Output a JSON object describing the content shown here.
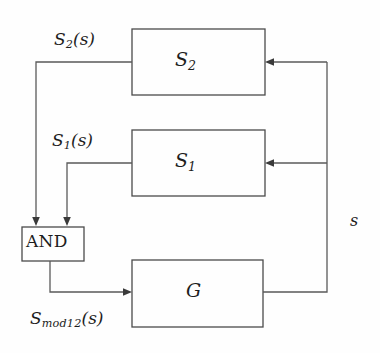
{
  "diagram": {
    "background_color": "#fefefe",
    "line_color": "#5a5a5a",
    "text_color": "#1d1d1d",
    "blocks": [
      {
        "id": "s2",
        "label": "S",
        "subscript": "2",
        "name": "block-s2",
        "x": 132,
        "y": 29,
        "w": 133,
        "h": 66
      },
      {
        "id": "s1",
        "label": "S",
        "subscript": "1",
        "name": "block-s1",
        "x": 132,
        "y": 130,
        "w": 133,
        "h": 66
      },
      {
        "id": "g",
        "label": "G",
        "subscript": "",
        "name": "block-g",
        "x": 132,
        "y": 260,
        "w": 131,
        "h": 67
      },
      {
        "id": "and",
        "label": "AND",
        "subscript": "",
        "name": "block-and",
        "x": 22,
        "y": 227,
        "w": 62,
        "h": 34
      }
    ],
    "signals": [
      {
        "id": "s2s",
        "label": "S",
        "subscript": "2",
        "arg": "(s)",
        "name": "signal-label-s2"
      },
      {
        "id": "s1s",
        "label": "S",
        "subscript": "1",
        "arg": "(s)",
        "name": "signal-label-s1"
      },
      {
        "id": "mod",
        "label": "S",
        "subscript": "mod12",
        "arg": "(s)",
        "name": "signal-label-smod12"
      },
      {
        "id": "fb",
        "label": "s",
        "subscript": "",
        "arg": "",
        "name": "signal-label-s"
      }
    ]
  }
}
